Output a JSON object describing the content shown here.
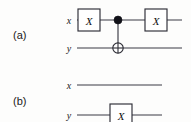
{
  "figure": {
    "kind": "quantum-circuit-equivalence",
    "background_color": "#fdfdfc",
    "ink_color": "#2e2e36",
    "panels": [
      {
        "id": "a",
        "label": "(a)",
        "label_x": 13,
        "label_y": 39,
        "wires": [
          {
            "id": "a-x",
            "label": "x",
            "label_x": 69,
            "label_y": 24,
            "y": 20,
            "x_start": 77,
            "x_end": 182
          },
          {
            "id": "a-y",
            "label": "y",
            "label_x": 69,
            "label_y": 52,
            "y": 48,
            "x_start": 77,
            "x_end": 182
          }
        ],
        "gates": [
          {
            "id": "a-x-gate-1",
            "type": "x-gate",
            "label": "X",
            "wire": "a-x",
            "cx": 89,
            "cy": 20,
            "w": 22,
            "h": 22
          },
          {
            "id": "a-x-gate-2",
            "type": "x-gate",
            "label": "X",
            "wire": "a-x",
            "cx": 156,
            "cy": 20,
            "w": 22,
            "h": 22
          }
        ],
        "cnot": {
          "id": "a-cnot",
          "type": "cnot",
          "control_x": 118,
          "control_y": 20,
          "control_radius": 4,
          "target_x": 118,
          "target_y": 48,
          "target_radius": 5.2
        }
      },
      {
        "id": "b",
        "label": "(b)",
        "label_x": 13,
        "label_y": 105,
        "wires": [
          {
            "id": "b-x",
            "label": "x",
            "label_x": 69,
            "label_y": 89,
            "y": 85,
            "x_start": 77,
            "x_end": 162
          },
          {
            "id": "b-y",
            "label": "y",
            "label_x": 69,
            "label_y": 119,
            "y": 115,
            "x_start": 77,
            "x_end": 162
          }
        ],
        "gates": [
          {
            "id": "b-y-gate-1",
            "type": "x-gate",
            "label": "X",
            "wire": "b-y",
            "cx": 121,
            "cy": 115,
            "w": 22,
            "h": 22
          }
        ],
        "cnot": null
      }
    ]
  }
}
